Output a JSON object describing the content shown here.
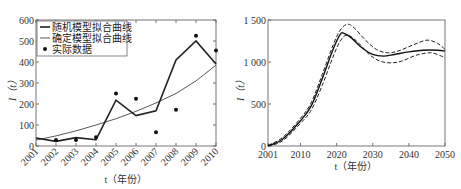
{
  "chart_data": [
    {
      "type": "line",
      "title": "",
      "xlabel": "t（年份）",
      "ylabel": "I（t）",
      "x": [
        2001,
        2002,
        2003,
        2004,
        2005,
        2006,
        2007,
        2008,
        2009,
        2010
      ],
      "ylim": [
        0,
        600
      ],
      "yticks": [
        0,
        100,
        200,
        300,
        400,
        500,
        600
      ],
      "xticks": [
        "2001",
        "2002",
        "2003",
        "2004",
        "2005",
        "2006",
        "2007",
        "2008",
        "2009",
        "2010"
      ],
      "legend_position": "upper left",
      "series": [
        {
          "name": "随机模型拟合曲线",
          "style": "thick solid",
          "values": [
            38,
            22,
            40,
            30,
            218,
            145,
            168,
            410,
            500,
            390
          ]
        },
        {
          "name": "确定模型拟合曲线",
          "style": "thin solid",
          "values": [
            28,
            48,
            72,
            100,
            130,
            165,
            205,
            250,
            310,
            385
          ]
        },
        {
          "name": "实际数据",
          "style": "markers",
          "values": [
            null,
            28,
            28,
            42,
            250,
            225,
            65,
            173,
            525,
            455
          ]
        }
      ]
    },
    {
      "type": "line",
      "title": "",
      "xlabel": "t（年份）",
      "ylabel": "I（t）",
      "xlim": [
        2001,
        2050
      ],
      "ylim": [
        0,
        1500
      ],
      "yticks": [
        "0",
        "500",
        "1 000",
        "1 500"
      ],
      "xticks": [
        "2001",
        "2010",
        "2020",
        "2030",
        "2040",
        "2050"
      ],
      "series": [
        {
          "name": "mean",
          "style": "solid",
          "x": [
            2001,
            2005,
            2010,
            2013,
            2016,
            2019,
            2021,
            2022,
            2024,
            2027,
            2030,
            2033,
            2036,
            2040,
            2044,
            2048,
            2050
          ],
          "values": [
            0,
            80,
            300,
            480,
            800,
            1150,
            1330,
            1340,
            1290,
            1170,
            1090,
            1070,
            1090,
            1120,
            1140,
            1140,
            1130
          ]
        },
        {
          "name": "upper bound",
          "style": "dashed",
          "x": [
            2001,
            2005,
            2010,
            2013,
            2016,
            2019,
            2021,
            2023,
            2025,
            2028,
            2031,
            2034,
            2037,
            2041,
            2045,
            2048,
            2050
          ],
          "values": [
            10,
            100,
            330,
            520,
            850,
            1200,
            1380,
            1450,
            1400,
            1260,
            1150,
            1110,
            1130,
            1200,
            1260,
            1220,
            1150
          ]
        },
        {
          "name": "lower bound",
          "style": "dashed",
          "x": [
            2001,
            2005,
            2010,
            2013,
            2016,
            2019,
            2021,
            2023,
            2026,
            2029,
            2032,
            2035,
            2038,
            2042,
            2046,
            2049,
            2050
          ],
          "values": [
            0,
            60,
            270,
            430,
            720,
            1060,
            1250,
            1320,
            1230,
            1090,
            1010,
            990,
            1010,
            1080,
            1110,
            1070,
            1050
          ]
        }
      ]
    }
  ],
  "left": {
    "ylabel": "I（t）",
    "xlabel": "t（年份）",
    "legend": [
      "随机模型拟合曲线",
      "确定模型拟合曲线",
      "实际数据"
    ],
    "yticks": [
      "0",
      "100",
      "200",
      "300",
      "400",
      "500",
      "600"
    ],
    "xticks": [
      "2001",
      "2002",
      "2003",
      "2004",
      "2005",
      "2006",
      "2007",
      "2008",
      "2009",
      "2010"
    ]
  },
  "right": {
    "ylabel": "I（t）",
    "xlabel": "t（年份）",
    "yticks": [
      "0",
      "500",
      "1 000",
      "1 500"
    ],
    "xticks": [
      "2001",
      "2010",
      "2020",
      "2030",
      "2040",
      "2050"
    ]
  }
}
